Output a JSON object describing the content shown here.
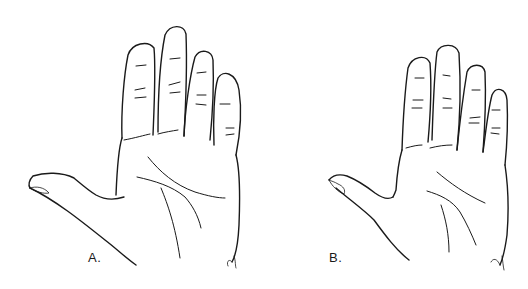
{
  "figure": {
    "panels": [
      {
        "id": "A",
        "label": "A.",
        "subject": "open hand, palm view, fingers slightly spread, thumb extended to the left"
      },
      {
        "id": "B",
        "label": "B.",
        "subject": "open hand, palm view, fingers slightly spread, thumb extended to the left"
      }
    ],
    "colors": {
      "ink": "#1a1a1a",
      "background": "#ffffff"
    }
  }
}
